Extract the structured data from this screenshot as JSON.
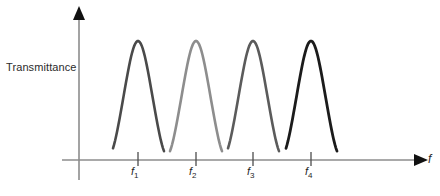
{
  "figure": {
    "background": "#ffffff",
    "y_axis_label": "Transmittance",
    "x_axis_label": "f",
    "axis_color": "#8c8c8c",
    "arrow_color": "#111111",
    "tick_color": "#4d4d4d"
  },
  "chart_data": {
    "type": "line",
    "title": "",
    "xlabel": "f",
    "ylabel": "Transmittance",
    "grid": false,
    "legend": "none",
    "xlim": [
      0,
      440
    ],
    "ylim": [
      0,
      1
    ],
    "x_tick_labels": [
      "f1",
      "f2",
      "f3",
      "f4"
    ],
    "x_tick_positions": [
      138,
      196,
      253,
      311
    ],
    "annotations": [
      {
        "text": "f",
        "role": "x-axis-name",
        "italic": true
      },
      {
        "text": "Transmittance",
        "role": "y-axis-name",
        "italic": false
      }
    ],
    "series": [
      {
        "name": "passband-1",
        "label": "f1",
        "center": 138,
        "peak_height": 1.0,
        "half_width": 13,
        "base_left": 113,
        "base_right": 164,
        "color": "#4a4a4a",
        "line_width": 2.6
      },
      {
        "name": "passband-2",
        "label": "f2",
        "center": 196,
        "peak_height": 1.0,
        "half_width": 13,
        "base_left": 170,
        "base_right": 222,
        "color": "#8d8d8d",
        "line_width": 2.6
      },
      {
        "name": "passband-3",
        "label": "f3",
        "center": 253,
        "peak_height": 1.0,
        "half_width": 13,
        "base_left": 228,
        "base_right": 279,
        "color": "#5b5b5b",
        "line_width": 2.6
      },
      {
        "name": "passband-4",
        "label": "f4",
        "center": 311,
        "peak_height": 1.0,
        "half_width": 13,
        "base_left": 286,
        "base_right": 337,
        "color": "#1b1b1b",
        "line_width": 2.8
      }
    ],
    "baseline_y": 160,
    "peak_top_y": 41
  },
  "tick_labels": [
    {
      "base": "f",
      "sub": "1"
    },
    {
      "base": "f",
      "sub": "2"
    },
    {
      "base": "f",
      "sub": "3"
    },
    {
      "base": "f",
      "sub": "4"
    }
  ]
}
